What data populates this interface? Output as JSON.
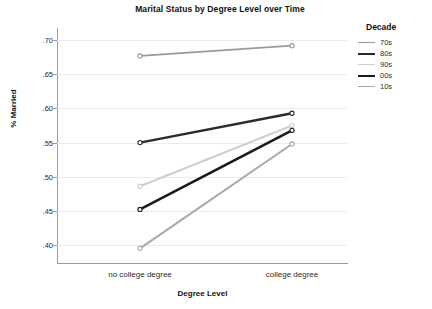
{
  "chart_data": {
    "type": "line",
    "title": "Marital Status by Degree Level over Time",
    "xlabel": "Degree Level",
    "ylabel": "% Married",
    "categories": [
      "no college degree",
      "college degree"
    ],
    "yticks": [
      ".40",
      ".45",
      ".50",
      ".55",
      ".60",
      ".65",
      ".70"
    ],
    "ytick_values": [
      0.4,
      0.45,
      0.5,
      0.55,
      0.6,
      0.65,
      0.7
    ],
    "ylim": [
      0.375,
      0.715
    ],
    "grid": true,
    "legend_position": "right",
    "legend_title": "Decade",
    "series": [
      {
        "name": "70s",
        "values": [
          0.677,
          0.692
        ],
        "color": "#9a9a9a",
        "width": 1.8
      },
      {
        "name": "80s",
        "values": [
          0.55,
          0.593
        ],
        "color": "#2b2b2b",
        "width": 2.4
      },
      {
        "name": "90s",
        "values": [
          0.486,
          0.575
        ],
        "color": "#cfcfcf",
        "width": 2.0
      },
      {
        "name": "00s",
        "values": [
          0.452,
          0.568
        ],
        "color": "#1a1a1a",
        "width": 2.6
      },
      {
        "name": "10s",
        "values": [
          0.395,
          0.548
        ],
        "color": "#a8a8a8",
        "width": 2.0
      }
    ]
  },
  "colors": {
    "axis": "#9a9a9a",
    "grid": "#ebebeb",
    "text": "#2b2b2b",
    "background": "#ffffff"
  }
}
